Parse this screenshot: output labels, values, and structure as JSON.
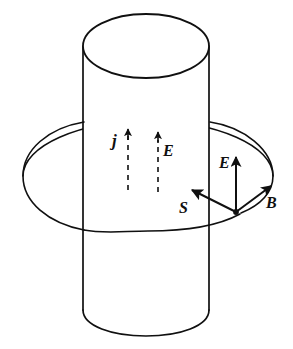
{
  "figure": {
    "background_color": "#ffffff",
    "stroke_color": "#101010",
    "width": 293,
    "height": 349
  },
  "labels": {
    "current_density": "j",
    "interior_field": "E",
    "surface_field": "E",
    "poynting": "S",
    "magnetic_field": "B"
  },
  "shapes": {
    "cylinder": {
      "name": "conducting-cylinder",
      "top_ellipse": {
        "cx": 146,
        "cy": 46,
        "rx": 63,
        "ry": 32
      },
      "left_wall_x": 83,
      "right_wall_x": 209,
      "bottom_y": 335
    },
    "field_loop": {
      "name": "magnetic-field-loop",
      "cx": 148,
      "cy": 176,
      "rx": 125,
      "ry": 55
    },
    "triad_origin": {
      "x": 236,
      "y": 212
    }
  },
  "arrows": {
    "current_density": {
      "type": "dashed",
      "x": 128,
      "tail_y": 190,
      "tip_y": 127
    },
    "interior_field": {
      "type": "dashed",
      "x": 158,
      "tail_y": 192,
      "tip_y": 130
    },
    "surface_field": {
      "type": "solid",
      "x": 236,
      "tail_y": 212,
      "tip_y": 152
    },
    "poynting": {
      "type": "solid",
      "tail_x": 236,
      "tail_y": 212,
      "tip_x": 189,
      "tip_y": 189
    },
    "magnetic_field": {
      "type": "solid",
      "tail_x": 236,
      "tail_y": 212,
      "tip_x": 274,
      "tip_y": 183
    }
  }
}
